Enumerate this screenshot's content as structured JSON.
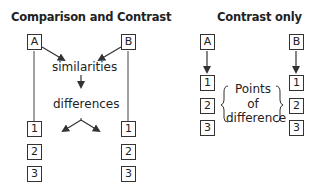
{
  "left_diagram": {
    "title": "Comparison and Contrast",
    "source_a": "A",
    "source_b": "B",
    "similarities_label": "similarities",
    "differences_label": "differences",
    "list_a": [
      "1",
      "2",
      "3"
    ],
    "list_b": [
      "1",
      "2",
      "3"
    ]
  },
  "right_diagram": {
    "title": "Contrast only",
    "source_a": "A",
    "source_b": "B",
    "list_a": [
      "1",
      "2",
      "3"
    ],
    "list_b": [
      "1",
      "2",
      "3"
    ],
    "points_label_line1": "Points",
    "points_label_line2": "of",
    "points_label_line3": "difference"
  },
  "colors": {
    "line": "#333333",
    "text": "#222222",
    "background": "#ffffff"
  }
}
